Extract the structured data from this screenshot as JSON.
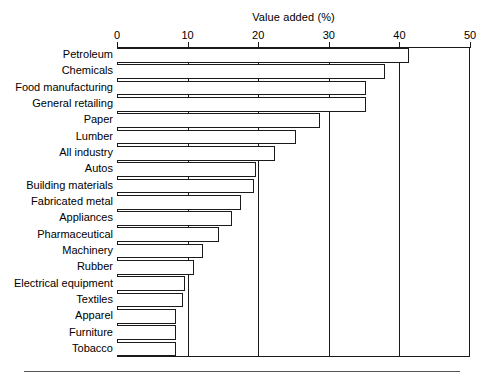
{
  "chart_data": {
    "type": "bar",
    "orientation": "horizontal",
    "title": "Value added (%)",
    "xlabel": "Value added (%)",
    "ylabel": "",
    "xlim": [
      0,
      50
    ],
    "xticks": [
      0,
      10,
      20,
      30,
      40,
      50
    ],
    "xtick_labels": [
      "0",
      "10",
      "20",
      "30",
      "40",
      "50"
    ],
    "grid": true,
    "grid_axis": "x",
    "legend": false,
    "axis_position": "top",
    "bar_fill": "#ffffff",
    "bar_edge": "#1a1a1a",
    "categories": [
      "Petroleum",
      "Chemicals",
      "Food manufacturing",
      "General retailing",
      "Paper",
      "Lumber",
      "All industry",
      "Autos",
      "Building materials",
      "Fabricated metal",
      "Appliances",
      "Pharmaceutical",
      "Machinery",
      "Rubber",
      "Electrical equipment",
      "Textiles",
      "Apparel",
      "Furniture",
      "Tobacco"
    ],
    "values": [
      41.3,
      37.9,
      35.3,
      35.2,
      28.8,
      25.4,
      22.4,
      19.7,
      19.4,
      17.6,
      16.3,
      14.5,
      12.2,
      10.9,
      9.6,
      9.4,
      8.4,
      8.4,
      8.4
    ]
  }
}
